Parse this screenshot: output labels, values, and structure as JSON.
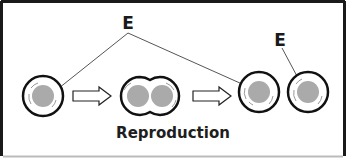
{
  "diagram": {
    "title": "Reproduction",
    "labels": [
      {
        "id": "top",
        "text": "E"
      },
      {
        "id": "right",
        "text": "E"
      }
    ],
    "stages": [
      {
        "name": "parent-cell",
        "nuclei": 1
      },
      {
        "name": "dividing-cell",
        "nuclei": 2
      },
      {
        "name": "daughter-cell-1",
        "nuclei": 1
      },
      {
        "name": "daughter-cell-2",
        "nuclei": 1
      }
    ],
    "colors": {
      "outline": "#111111",
      "nucleus": "#aaaaaa",
      "pointer_line": "#555555",
      "frame": "#1a1a1a",
      "frame_bottom": "#bbbbbb"
    }
  }
}
